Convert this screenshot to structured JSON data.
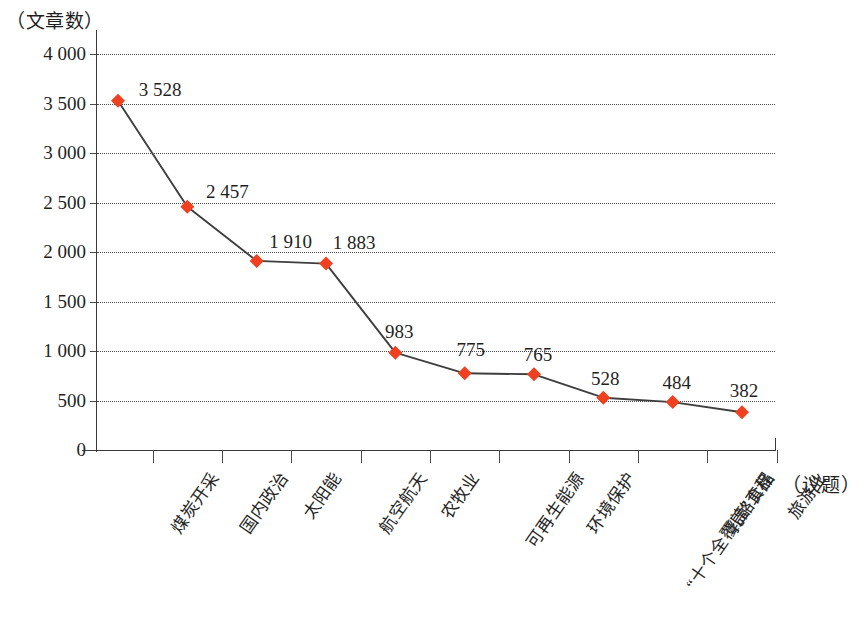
{
  "chart_data": {
    "type": "line",
    "title": "",
    "subtitle": "",
    "xlabel": "（议题）",
    "ylabel": "（文章数）",
    "categories": [
      "煤炭开采",
      "国内政治",
      "太阳能",
      "航空航天",
      "农牧业",
      "可再生能源",
      "环境保护",
      "“十个全覆盖”工程",
      "乳酪食品",
      "旅游业"
    ],
    "values": [
      3528,
      2457,
      1910,
      1883,
      983,
      775,
      765,
      528,
      484,
      382
    ],
    "value_labels": [
      "3 528",
      "2 457",
      "1 910",
      "1 883",
      "983",
      "775",
      "765",
      "528",
      "484",
      "382"
    ],
    "ylim": [
      0,
      4000
    ],
    "ytick_values": [
      0,
      500,
      1000,
      1500,
      2000,
      2500,
      3000,
      3500,
      4000
    ],
    "ytick_labels": [
      "0",
      "500",
      "1 000",
      "1 500",
      "2 000",
      "2 500",
      "3 000",
      "3 500",
      "4 000"
    ],
    "grid": "horizontal-dotted",
    "legend": "none",
    "series": [
      {
        "name": "文章数",
        "marker": "diamond",
        "marker_color": "#ef4020",
        "line_color": "#3f3f3f",
        "values": [
          3528,
          2457,
          1910,
          1883,
          983,
          775,
          765,
          528,
          484,
          382
        ]
      }
    ]
  },
  "style": {
    "marker_color": "#ef4020",
    "line_color": "#3f3f3f",
    "axis_color": "#3a3a3a",
    "grid_color": "#4a4a4a",
    "text_color": "#1f1f1f",
    "background": "#ffffff"
  }
}
